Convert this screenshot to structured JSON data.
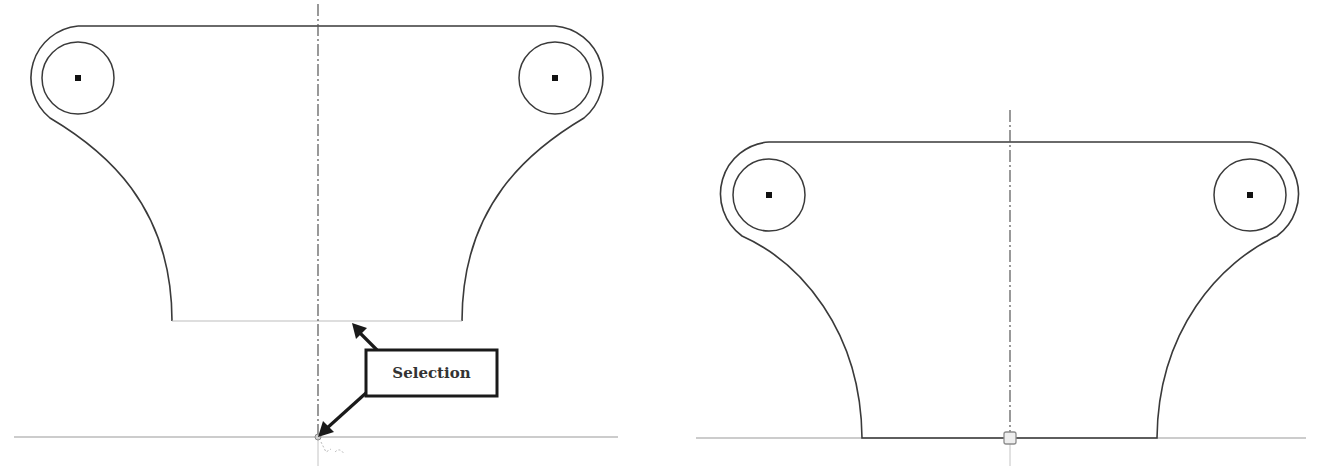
{
  "figure": {
    "left_view": {
      "name": "before",
      "callout": {
        "label": "Selection",
        "box": {
          "x": 366,
          "y": 350,
          "w": 131,
          "h": 46
        },
        "arrow_targets": [
          {
            "name": "bottom-edge",
            "x": 352,
            "y": 323
          },
          {
            "name": "centerline-endpoint",
            "x": 318,
            "y": 437
          }
        ]
      },
      "centerline_x": 318,
      "bottom_edge_y": 321,
      "ground_line_y": 437,
      "hole_centers": [
        {
          "x": 78,
          "y": 78
        },
        {
          "x": 555,
          "y": 78
        }
      ]
    },
    "right_view": {
      "name": "after",
      "centerline_x": 1010,
      "top_edge_y": 142,
      "ground_line_y": 438,
      "hole_centers": [
        {
          "x": 769,
          "y": 195
        },
        {
          "x": 1250,
          "y": 195
        }
      ],
      "snap_marker": {
        "x": 1010,
        "y": 438
      }
    },
    "colors": {
      "line": "#3a3a3a",
      "construction": "#9a9a9a",
      "callout": "#1a1a1a",
      "background": "#ffffff"
    }
  }
}
